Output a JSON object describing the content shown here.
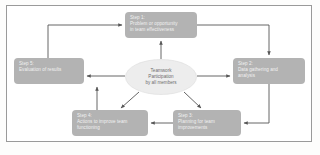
{
  "figure": {
    "type": "cycle-flow-diagram",
    "background_color": "#ffffff",
    "frame_color": "#9a9a9a",
    "node_fill_color": "#b3b3b3",
    "node_text_color": "#f2f2f2",
    "center_fill_color": "#ededed",
    "center_text_color": "#6d6d6d",
    "connector_color": "#555555"
  },
  "center": {
    "name": "teamwork-participation",
    "lines": [
      "Teamwork",
      "Participation",
      "by all members"
    ]
  },
  "nodes": [
    {
      "id": "step1",
      "title": "Step 1:",
      "lines": [
        "Problem or opportunity",
        "in team effectiveness"
      ]
    },
    {
      "id": "step2",
      "title": "Step 2:",
      "lines": [
        "Data gathering and",
        "analysis"
      ]
    },
    {
      "id": "step3",
      "title": "Step 3:",
      "lines": [
        "Planning for team",
        "improvements"
      ]
    },
    {
      "id": "step4",
      "title": "Step 4:",
      "lines": [
        "Actions to improve team",
        "functioning"
      ]
    },
    {
      "id": "step5",
      "title": "Step 5:",
      "lines": [
        "Evaluation of results"
      ]
    }
  ],
  "connections": [
    {
      "from": "step1",
      "to": "step2",
      "style": "elbow"
    },
    {
      "from": "step2",
      "to": "step3",
      "style": "elbow"
    },
    {
      "from": "step3",
      "to": "step4",
      "style": "straight"
    },
    {
      "from": "step4",
      "to": "step5",
      "style": "elbow"
    },
    {
      "from": "step5",
      "to": "step1",
      "style": "elbow"
    },
    {
      "from": "center",
      "to": "step1",
      "style": "radial"
    },
    {
      "from": "center",
      "to": "step2",
      "style": "radial"
    },
    {
      "from": "center",
      "to": "step3",
      "style": "radial"
    },
    {
      "from": "center",
      "to": "step4",
      "style": "radial"
    },
    {
      "from": "center",
      "to": "step5",
      "style": "radial"
    }
  ]
}
